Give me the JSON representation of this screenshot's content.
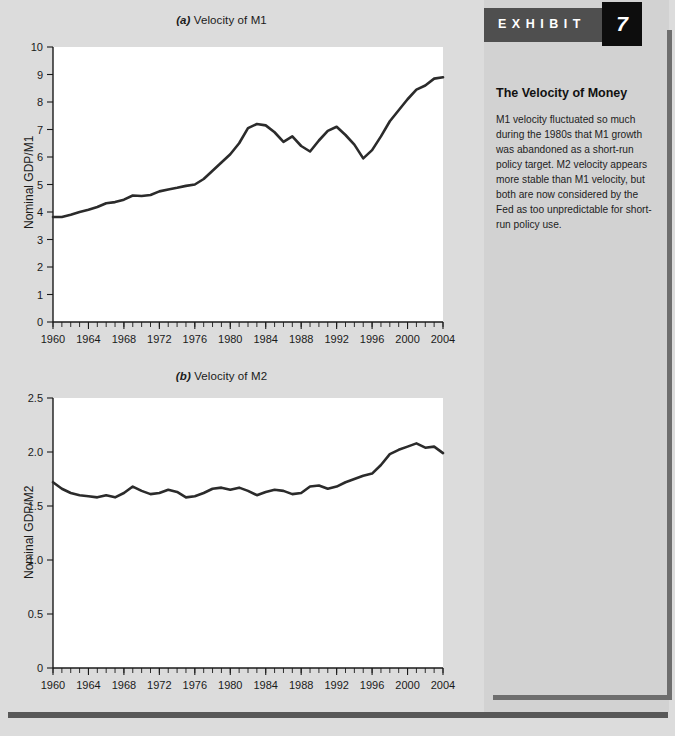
{
  "exhibit": {
    "word": "EXHIBIT",
    "number": "7",
    "heading": "The Velocity of Money",
    "body": "M1 velocity fluctuated so much during the 1980s that M1 growth was abandoned as a short-run policy target. M2 velocity appears more stable than M1 velocity, but both are now considered by the Fed as too unpredictable for short-run policy use."
  },
  "chart_data": [
    {
      "type": "line",
      "panel": "a",
      "panel_label": "(a)",
      "title": "Velocity of M1",
      "xlabel": "",
      "ylabel": "Nominal GDP/M1",
      "xlim": [
        1960,
        2004
      ],
      "ylim": [
        0,
        10
      ],
      "ytick_step": 1,
      "xtick_step": 4,
      "xtick_minor_step": 1,
      "grid": false,
      "legend": "none",
      "ytick_labels": [
        "0",
        "1",
        "2",
        "3",
        "4",
        "5",
        "6",
        "7",
        "8",
        "9",
        "10"
      ],
      "xtick_labels": [
        "1960",
        "1964",
        "1968",
        "1972",
        "1976",
        "1980",
        "1984",
        "1988",
        "1992",
        "1996",
        "2000",
        "2004"
      ],
      "x": [
        1960,
        1961,
        1962,
        1963,
        1964,
        1965,
        1966,
        1967,
        1968,
        1969,
        1970,
        1971,
        1972,
        1973,
        1974,
        1975,
        1976,
        1977,
        1978,
        1979,
        1980,
        1981,
        1982,
        1983,
        1984,
        1985,
        1986,
        1987,
        1988,
        1989,
        1990,
        1991,
        1992,
        1993,
        1994,
        1995,
        1996,
        1997,
        1998,
        1999,
        2000,
        2001,
        2002,
        2003,
        2004
      ],
      "values": [
        3.82,
        3.82,
        3.9,
        4.0,
        4.08,
        4.18,
        4.32,
        4.36,
        4.45,
        4.6,
        4.58,
        4.62,
        4.75,
        4.82,
        4.88,
        4.95,
        5.0,
        5.2,
        5.5,
        5.8,
        6.1,
        6.5,
        7.05,
        7.2,
        7.15,
        6.9,
        6.55,
        6.75,
        6.4,
        6.2,
        6.6,
        6.95,
        7.1,
        6.8,
        6.45,
        5.95,
        6.25,
        6.75,
        7.3,
        7.7,
        8.1,
        8.45,
        8.6,
        8.85,
        8.9,
        8.62,
        8.72,
        8.7,
        8.58
      ]
    },
    {
      "type": "line",
      "panel": "b",
      "panel_label": "(b)",
      "title": "Velocity of M2",
      "xlabel": "",
      "ylabel": "Nominal GDP/M2",
      "xlim": [
        1960,
        2004
      ],
      "ylim": [
        0,
        2.5
      ],
      "ytick_step": 0.5,
      "xtick_step": 4,
      "xtick_minor_step": 1,
      "grid": false,
      "legend": "none",
      "ytick_labels": [
        "0",
        "0.5",
        "1.0",
        "1.5",
        "2.0",
        "2.5"
      ],
      "xtick_labels": [
        "1960",
        "1964",
        "1968",
        "1972",
        "1976",
        "1980",
        "1984",
        "1988",
        "1992",
        "1996",
        "2000",
        "2004"
      ],
      "x": [
        1960,
        1961,
        1962,
        1963,
        1964,
        1965,
        1966,
        1967,
        1968,
        1969,
        1970,
        1971,
        1972,
        1973,
        1974,
        1975,
        1976,
        1977,
        1978,
        1979,
        1980,
        1981,
        1982,
        1983,
        1984,
        1985,
        1986,
        1987,
        1988,
        1989,
        1990,
        1991,
        1992,
        1993,
        1994,
        1995,
        1996,
        1997,
        1998,
        1999,
        2000,
        2001,
        2002,
        2003,
        2004
      ],
      "values": [
        1.72,
        1.66,
        1.62,
        1.6,
        1.59,
        1.58,
        1.6,
        1.58,
        1.62,
        1.68,
        1.64,
        1.61,
        1.62,
        1.65,
        1.63,
        1.58,
        1.59,
        1.62,
        1.66,
        1.67,
        1.65,
        1.67,
        1.64,
        1.6,
        1.63,
        1.65,
        1.64,
        1.61,
        1.62,
        1.68,
        1.69,
        1.66,
        1.68,
        1.72,
        1.75,
        1.78,
        1.8,
        1.88,
        1.98,
        2.02,
        2.05,
        2.08,
        2.04,
        2.05,
        1.99,
        1.95,
        1.84,
        1.82,
        1.81
      ]
    }
  ]
}
